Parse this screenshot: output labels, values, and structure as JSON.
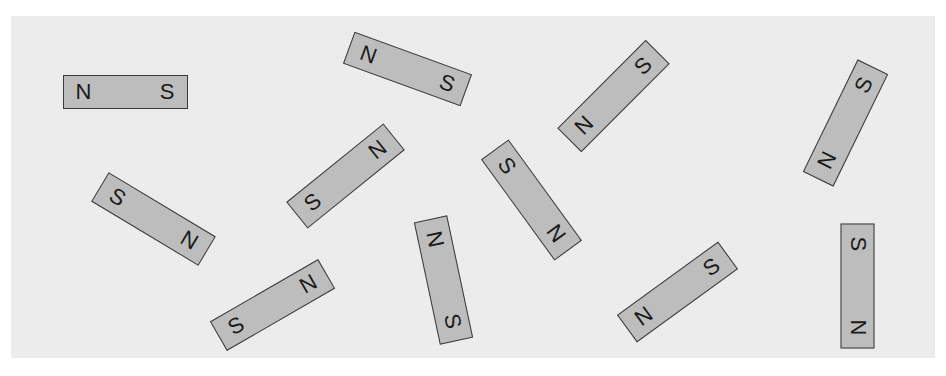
{
  "figure": {
    "background_color": "#ececec",
    "magnet_fill": "#bdbdbd",
    "magnet_border": "#3a3a3a",
    "magnets": [
      {
        "left": "N",
        "right": "S",
        "cx": 125,
        "cy": 92,
        "angle": 0
      },
      {
        "left": "N",
        "right": "S",
        "cx": 407,
        "cy": 69,
        "angle": 20
      },
      {
        "left": "N",
        "right": "S",
        "cx": 613,
        "cy": 96,
        "angle": -45
      },
      {
        "left": "N",
        "right": "S",
        "cx": 845,
        "cy": 123,
        "angle": -64
      },
      {
        "left": "S",
        "right": "N",
        "cx": 153,
        "cy": 219,
        "angle": 31
      },
      {
        "left": "S",
        "right": "N",
        "cx": 345,
        "cy": 176,
        "angle": -39
      },
      {
        "left": "S",
        "right": "N",
        "cx": 531,
        "cy": 200,
        "angle": 54
      },
      {
        "left": "N",
        "right": "S",
        "cx": 443,
        "cy": 280,
        "angle": 78
      },
      {
        "left": "S",
        "right": "N",
        "cx": 272,
        "cy": 305,
        "angle": -30
      },
      {
        "left": "N",
        "right": "S",
        "cx": 677,
        "cy": 292,
        "angle": -36
      },
      {
        "left": "S",
        "right": "N",
        "cx": 857,
        "cy": 286,
        "angle": 90
      }
    ]
  }
}
